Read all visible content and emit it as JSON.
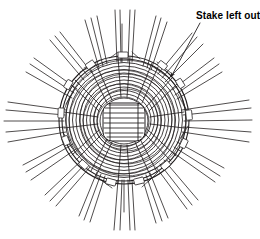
{
  "figure": {
    "kind": "line-drawing",
    "background_color": "#ffffff",
    "line_color": "#231f20",
    "canvas": {
      "width": 260,
      "height": 239
    }
  },
  "annotations": [
    {
      "id": "stake-left-out",
      "label": "Stake left out",
      "text_x": 196,
      "text_y": 18,
      "leader": {
        "x1": 199,
        "y1": 22,
        "x2": 170,
        "y2": 78
      },
      "arrow_at": {
        "x": 170,
        "y": 78
      }
    }
  ],
  "weave": {
    "center_x": 124,
    "center_y": 120,
    "disc_radius_x": 66,
    "disc_radius_y": 65,
    "ring_count": 9,
    "stake_count": 16,
    "core_label": "woven-base-core",
    "core": {
      "cx": 124,
      "cy": 122,
      "rx": 21,
      "ry": 19,
      "rung_count": 8
    },
    "stake_angles_deg": [
      268,
      290,
      312,
      334,
      356,
      18,
      40,
      62,
      84,
      106,
      128,
      150,
      172,
      194,
      216,
      240
    ],
    "missing_stake_angle_deg": 312
  }
}
